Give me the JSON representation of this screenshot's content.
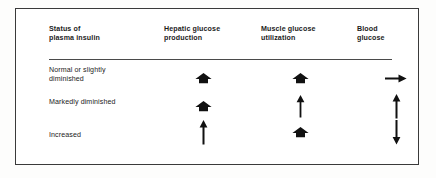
{
  "figure": {
    "frame_color": "#3a3a3a",
    "background": "#ffffff",
    "ink_color": "#111111"
  },
  "table": {
    "headers": [
      "Status of\nplasma insulin",
      "Hepatic glucose\nproduction",
      "Muscle glucose\nutilization",
      "Blood\nglucose"
    ],
    "rows": [
      {
        "label": "Normal or slightly\ndiminished",
        "cells": [
          {
            "column": "Hepatic glucose production",
            "symbol": "thick-up-arrow",
            "meaning": "markedly increased"
          },
          {
            "column": "Muscle glucose utilization",
            "symbol": "thick-up-arrow",
            "meaning": "markedly increased"
          },
          {
            "column": "Blood glucose",
            "symbol": "right-arrow",
            "meaning": "unchanged"
          }
        ]
      },
      {
        "label": "Markedly diminished",
        "cells": [
          {
            "column": "Hepatic glucose production",
            "symbol": "thick-up-arrow",
            "meaning": "markedly increased"
          },
          {
            "column": "Muscle glucose utilization",
            "symbol": "thin-up-arrow",
            "meaning": "increased"
          },
          {
            "column": "Blood glucose",
            "symbol": "thin-up-arrow",
            "meaning": "increased"
          }
        ]
      },
      {
        "label": "Increased",
        "cells": [
          {
            "column": "Hepatic glucose production",
            "symbol": "thin-up-arrow",
            "meaning": "increased"
          },
          {
            "column": "Muscle glucose utilization",
            "symbol": "thick-up-arrow",
            "meaning": "markedly increased"
          },
          {
            "column": "Blood glucose",
            "symbol": "thin-down-arrow",
            "meaning": "decreased"
          }
        ]
      }
    ]
  }
}
